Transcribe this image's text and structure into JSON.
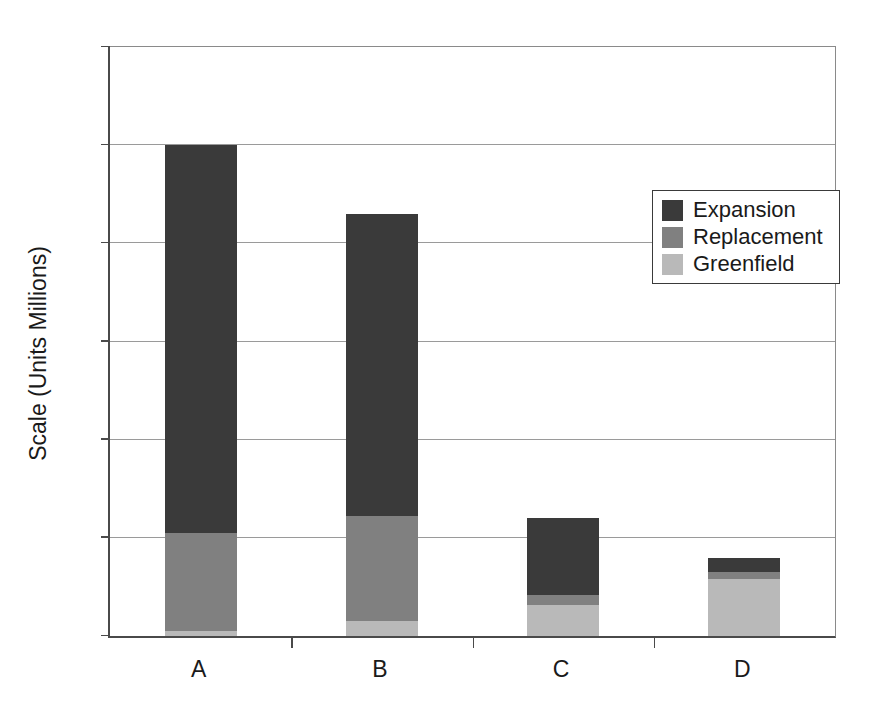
{
  "chart_data": {
    "type": "bar",
    "stacked": true,
    "title": "",
    "xlabel": "",
    "ylabel": "Scale (Units Millions)",
    "categories": [
      "A",
      "B",
      "C",
      "D"
    ],
    "ylim": [
      0,
      6
    ],
    "yticks": [
      0,
      1,
      2,
      3,
      4,
      5,
      6
    ],
    "ytick_labels": [
      "0",
      "1",
      "2",
      "3",
      "4",
      "5",
      "6"
    ],
    "grid": true,
    "legend_position": "upper right",
    "series": [
      {
        "name": "Greenfield",
        "color": "#b9b9b9",
        "values": [
          0.05,
          0.15,
          0.32,
          0.58
        ]
      },
      {
        "name": "Replacement",
        "color": "#808080",
        "values": [
          1.0,
          1.07,
          0.1,
          0.07
        ]
      },
      {
        "name": "Expansion",
        "color": "#3a3a3a",
        "values": [
          3.95,
          3.08,
          0.78,
          0.15
        ]
      }
    ],
    "totals": [
      5.0,
      4.3,
      1.2,
      0.8
    ]
  },
  "legend": {
    "entries": [
      {
        "label": "Expansion",
        "color": "#3a3a3a"
      },
      {
        "label": "Replacement",
        "color": "#808080"
      },
      {
        "label": "Greenfield",
        "color": "#b9b9b9"
      }
    ]
  },
  "axes": {
    "y_title": "Scale (Units Millions)"
  }
}
